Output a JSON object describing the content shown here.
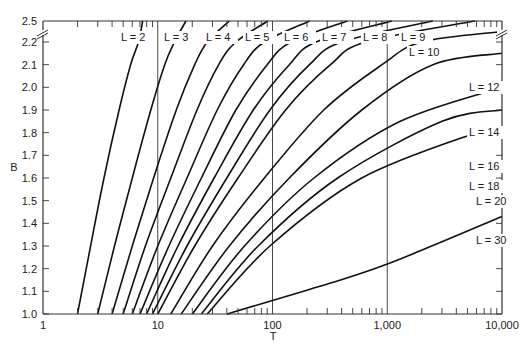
{
  "chart_data": {
    "type": "line",
    "title": "",
    "xlabel": "T",
    "ylabel": "B",
    "xscale": "log",
    "xlim": [
      1,
      10000
    ],
    "ylim": [
      1.0,
      2.5
    ],
    "y_axis_break": {
      "between": [
        2.2,
        2.5
      ]
    },
    "x_ticks": [
      {
        "value": 1,
        "label": "1"
      },
      {
        "value": 10,
        "label": "10"
      },
      {
        "value": 100,
        "label": "100"
      },
      {
        "value": 1000,
        "label": "1,000"
      },
      {
        "value": 10000,
        "label": "10,000"
      }
    ],
    "y_ticks": [
      {
        "value": 1.0,
        "label": "1.0"
      },
      {
        "value": 1.1,
        "label": "1.1"
      },
      {
        "value": 1.2,
        "label": "1.2"
      },
      {
        "value": 1.3,
        "label": "1.3"
      },
      {
        "value": 1.4,
        "label": "1.4"
      },
      {
        "value": 1.5,
        "label": "1.5"
      },
      {
        "value": 1.6,
        "label": "1.6"
      },
      {
        "value": 1.7,
        "label": "1.7"
      },
      {
        "value": 1.8,
        "label": "1.8"
      },
      {
        "value": 1.9,
        "label": "1.9"
      },
      {
        "value": 2.0,
        "label": "2.0"
      },
      {
        "value": 2.1,
        "label": "2.1"
      },
      {
        "value": 2.2,
        "label": "2.2"
      },
      {
        "value": 2.5,
        "label": "2.5"
      }
    ],
    "vertical_gridlines": [
      10,
      100,
      1000
    ],
    "grid": false,
    "legend": "inline labels",
    "series": [
      {
        "name": "L = 2",
        "points": [
          [
            2,
            1.0
          ],
          [
            2.6,
            1.3
          ],
          [
            3.4,
            1.6
          ],
          [
            4.6,
            1.9
          ],
          [
            5.8,
            2.1
          ],
          [
            6.8,
            2.2
          ],
          [
            7.4,
            2.5
          ]
        ]
      },
      {
        "name": "L = 3",
        "points": [
          [
            3,
            1.0
          ],
          [
            4.2,
            1.3
          ],
          [
            6,
            1.6
          ],
          [
            8.7,
            1.9
          ],
          [
            11.5,
            2.1
          ],
          [
            14,
            2.2
          ],
          [
            17.6,
            2.5
          ]
        ]
      },
      {
        "name": "L = 4",
        "points": [
          [
            4,
            1.0
          ],
          [
            6,
            1.3
          ],
          [
            9.2,
            1.6
          ],
          [
            14.5,
            1.9
          ],
          [
            21,
            2.1
          ],
          [
            27,
            2.2
          ],
          [
            42,
            2.5
          ]
        ]
      },
      {
        "name": "L = 5",
        "points": [
          [
            5,
            1.0
          ],
          [
            7.8,
            1.3
          ],
          [
            13,
            1.6
          ],
          [
            22,
            1.9
          ],
          [
            34,
            2.1
          ],
          [
            48,
            2.2
          ],
          [
            91,
            2.5
          ]
        ]
      },
      {
        "name": "L = 6",
        "points": [
          [
            6,
            1.0
          ],
          [
            10,
            1.3
          ],
          [
            18,
            1.6
          ],
          [
            33,
            1.9
          ],
          [
            56,
            2.1
          ],
          [
            85,
            2.2
          ],
          [
            211,
            2.5
          ]
        ]
      },
      {
        "name": "L = 7",
        "points": [
          [
            7,
            1.0
          ],
          [
            12.5,
            1.3
          ],
          [
            24,
            1.6
          ],
          [
            48,
            1.9
          ],
          [
            90,
            2.1
          ],
          [
            145,
            2.2
          ],
          [
            450,
            2.5
          ]
        ]
      },
      {
        "name": "L = 8",
        "points": [
          [
            8,
            1.0
          ],
          [
            15,
            1.3
          ],
          [
            31,
            1.6
          ],
          [
            68,
            1.9
          ],
          [
            140,
            2.1
          ],
          [
            240,
            2.2
          ],
          [
            1100,
            2.5
          ]
        ]
      },
      {
        "name": "L = 9",
        "points": [
          [
            9,
            1.0
          ],
          [
            18,
            1.3
          ],
          [
            40,
            1.6
          ],
          [
            95,
            1.9
          ],
          [
            210,
            2.1
          ],
          [
            400,
            2.2
          ],
          [
            2500,
            2.5
          ]
        ]
      },
      {
        "name": "L = 10",
        "points": [
          [
            10,
            1.0
          ],
          [
            21,
            1.3
          ],
          [
            50,
            1.6
          ],
          [
            130,
            1.9
          ],
          [
            320,
            2.1
          ],
          [
            650,
            2.2
          ],
          [
            5800,
            2.5
          ]
        ]
      },
      {
        "name": "L = 12",
        "points": [
          [
            13,
            1.0
          ],
          [
            30,
            1.3
          ],
          [
            85,
            1.6
          ],
          [
            280,
            1.9
          ],
          [
            900,
            2.1
          ],
          [
            2000,
            2.2
          ],
          [
            10000,
            2.35
          ]
        ]
      },
      {
        "name": "L = 14",
        "points": [
          [
            16,
            1.0
          ],
          [
            42,
            1.3
          ],
          [
            140,
            1.6
          ],
          [
            600,
            1.9
          ],
          [
            2500,
            2.1
          ],
          [
            10000,
            2.15
          ]
        ]
      },
      {
        "name": "L = 16",
        "points": [
          [
            20,
            1.0
          ],
          [
            57,
            1.3
          ],
          [
            230,
            1.6
          ],
          [
            1300,
            1.85
          ],
          [
            10000,
            2.0
          ]
        ]
      },
      {
        "name": "L = 18",
        "points": [
          [
            24,
            1.0
          ],
          [
            75,
            1.3
          ],
          [
            370,
            1.6
          ],
          [
            3000,
            1.85
          ],
          [
            10000,
            1.9
          ]
        ]
      },
      {
        "name": "L = 20",
        "points": [
          [
            27,
            1.0
          ],
          [
            95,
            1.3
          ],
          [
            600,
            1.6
          ],
          [
            6000,
            1.8
          ],
          [
            10000,
            1.82
          ]
        ]
      },
      {
        "name": "L = 30",
        "points": [
          [
            40,
            1.0
          ],
          [
            250,
            1.12
          ],
          [
            1000,
            1.22
          ],
          [
            10000,
            1.43
          ]
        ]
      }
    ],
    "labels": [
      {
        "text": "L = 2",
        "x": 121,
        "y": 41
      },
      {
        "text": "L = 3",
        "x": 164,
        "y": 41
      },
      {
        "text": "L = 4",
        "x": 206,
        "y": 41
      },
      {
        "text": "L = 5",
        "x": 245,
        "y": 41
      },
      {
        "text": "L = 6",
        "x": 284,
        "y": 41
      },
      {
        "text": "L = 7",
        "x": 322,
        "y": 41
      },
      {
        "text": "L = 8",
        "x": 363,
        "y": 41
      },
      {
        "text": "L = 9",
        "x": 401,
        "y": 41
      },
      {
        "text": "L = 10",
        "x": 409,
        "y": 56
      },
      {
        "text": "L = 12",
        "x": 469,
        "y": 91
      },
      {
        "text": "L = 14",
        "x": 469,
        "y": 136
      },
      {
        "text": "L = 16",
        "x": 469,
        "y": 170
      },
      {
        "text": "L = 18",
        "x": 469,
        "y": 190
      },
      {
        "text": "L = 20",
        "x": 476,
        "y": 205
      },
      {
        "text": "L = 30",
        "x": 476,
        "y": 244
      }
    ]
  }
}
